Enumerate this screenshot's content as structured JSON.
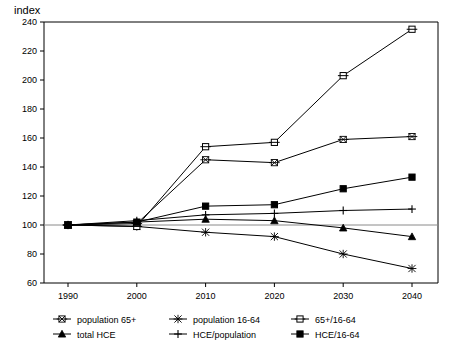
{
  "chart_data": {
    "type": "line",
    "title": "",
    "ylabel": "index",
    "xlabel": "",
    "categories": [
      "1990",
      "2000",
      "2010",
      "2020",
      "2030",
      "2040"
    ],
    "x": [
      1990,
      2000,
      2010,
      2020,
      2030,
      2040
    ],
    "ylim": [
      60,
      240
    ],
    "xlim": [
      1985,
      2045
    ],
    "ytick_labels": [
      "60",
      "80",
      "100",
      "120",
      "140",
      "160",
      "180",
      "200",
      "220",
      "240"
    ],
    "yticks": [
      60,
      80,
      100,
      120,
      140,
      160,
      180,
      200,
      220,
      240
    ],
    "grid": false,
    "legend_position": "bottom",
    "reference_line": 100,
    "series": [
      {
        "name": "population 65+",
        "marker": "x-in-square",
        "values": [
          100,
          101,
          145,
          143,
          159,
          161
        ]
      },
      {
        "name": "population 16-64",
        "marker": "asterisk",
        "values": [
          100,
          99,
          95,
          92,
          80,
          70
        ]
      },
      {
        "name": "65+/16-64",
        "marker": "open-square",
        "values": [
          100,
          99,
          154,
          157,
          203,
          235
        ]
      },
      {
        "name": "total HCE",
        "marker": "filled-triangle",
        "values": [
          100,
          102,
          104,
          103,
          98,
          92
        ]
      },
      {
        "name": "HCE/population",
        "marker": "plus",
        "values": [
          100,
          103,
          107,
          108,
          110,
          111
        ]
      },
      {
        "name": "HCE/16-64",
        "marker": "filled-square",
        "values": [
          100,
          102,
          113,
          114,
          125,
          133
        ]
      }
    ]
  },
  "legend": {
    "items": [
      {
        "label": "population 65+",
        "marker": "x-in-square"
      },
      {
        "label": "population 16-64",
        "marker": "asterisk"
      },
      {
        "label": "65+/16-64",
        "marker": "open-square"
      },
      {
        "label": "total HCE",
        "marker": "filled-triangle"
      },
      {
        "label": "HCE/population",
        "marker": "plus"
      },
      {
        "label": "HCE/16-64",
        "marker": "filled-square"
      }
    ]
  },
  "colors": {
    "ink": "#000000",
    "baseline": "#8a8a8a",
    "background": "#ffffff"
  }
}
